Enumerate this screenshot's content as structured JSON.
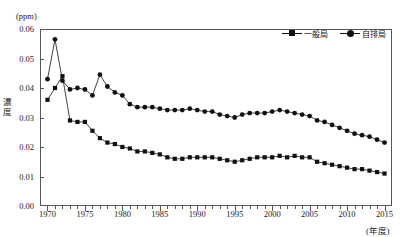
{
  "header": {
    "cropped_left_text": "",
    "cropped_right_text": ""
  },
  "axes": {
    "unit_label": "(ppm)",
    "y_title_chars": [
      "濃",
      "度"
    ],
    "x_title": "(年度)"
  },
  "legend": {
    "position": "top-right",
    "entries": [
      {
        "label": "一般局",
        "marker": "square",
        "color": "#111111"
      },
      {
        "label": "自排局",
        "marker": "circle",
        "color": "#111111"
      }
    ]
  },
  "chart_data": {
    "type": "line",
    "title": "",
    "subtitle": "",
    "xlabel": "(年度)",
    "ylabel": "濃度",
    "unit": "ppm",
    "xlim": [
      1969,
      2016
    ],
    "ylim": [
      0.0,
      0.06
    ],
    "ytick_values": [
      0.0,
      0.01,
      0.02,
      0.03,
      0.04,
      0.05,
      0.06
    ],
    "ytick_labels": [
      "0.00",
      "0.01",
      "0.02",
      "0.03",
      "0.04",
      "0.05",
      "0.06"
    ],
    "xtick_values": [
      1970,
      1975,
      1980,
      1985,
      1990,
      1995,
      2000,
      2005,
      2010,
      2015
    ],
    "xtick_labels": [
      "1970",
      "1975",
      "1980",
      "1985",
      "1990",
      "1995",
      "2000",
      "2005",
      "2010",
      "2015"
    ],
    "xtick_minor_step": 1,
    "grid": false,
    "legend_position": "top-right",
    "x": [
      1970,
      1971,
      1972,
      1973,
      1974,
      1975,
      1976,
      1977,
      1978,
      1979,
      1980,
      1981,
      1982,
      1983,
      1984,
      1985,
      1986,
      1987,
      1988,
      1989,
      1990,
      1991,
      1992,
      1993,
      1994,
      1995,
      1996,
      1997,
      1998,
      1999,
      2000,
      2001,
      2002,
      2003,
      2004,
      2005,
      2006,
      2007,
      2008,
      2009,
      2010,
      2011,
      2012,
      2013,
      2014,
      2015
    ],
    "series": [
      {
        "name": "一般局",
        "marker": "square",
        "color": "#111111",
        "values": [
          0.036,
          0.04,
          0.044,
          0.029,
          0.0285,
          0.0285,
          0.0255,
          0.023,
          0.0215,
          0.021,
          0.02,
          0.0195,
          0.0185,
          0.0185,
          0.018,
          0.0175,
          0.0165,
          0.016,
          0.016,
          0.0165,
          0.0165,
          0.0165,
          0.0165,
          0.016,
          0.0155,
          0.015,
          0.0155,
          0.016,
          0.0165,
          0.0165,
          0.0165,
          0.017,
          0.0165,
          0.017,
          0.0165,
          0.0165,
          0.015,
          0.0145,
          0.014,
          0.0135,
          0.013,
          0.0125,
          0.0125,
          0.012,
          0.0115,
          0.011
        ]
      },
      {
        "name": "自排局",
        "marker": "circle",
        "color": "#111111",
        "values": [
          0.043,
          0.0565,
          0.0425,
          0.0395,
          0.04,
          0.0395,
          0.0375,
          0.0445,
          0.0405,
          0.0385,
          0.0375,
          0.0345,
          0.0335,
          0.0335,
          0.0335,
          0.033,
          0.0325,
          0.0325,
          0.0325,
          0.033,
          0.0325,
          0.032,
          0.032,
          0.031,
          0.0305,
          0.03,
          0.031,
          0.0315,
          0.0315,
          0.0315,
          0.032,
          0.0325,
          0.032,
          0.0315,
          0.031,
          0.0305,
          0.029,
          0.0285,
          0.0275,
          0.0265,
          0.0255,
          0.0245,
          0.024,
          0.0235,
          0.0225,
          0.0215
        ]
      }
    ]
  }
}
